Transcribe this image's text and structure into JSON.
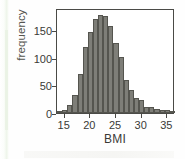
{
  "figure": {
    "name": "bmi-histogram"
  },
  "chart_data": {
    "type": "bar",
    "title": "",
    "xlabel": "BMI",
    "ylabel": "frequency",
    "xlim": [
      13.5,
      36.5
    ],
    "ylim": [
      0,
      190
    ],
    "grid": false,
    "legend": null,
    "bin_width": 1,
    "categories": [
      14,
      15,
      16,
      17,
      18,
      19,
      20,
      21,
      22,
      23,
      24,
      25,
      26,
      27,
      28,
      29,
      30,
      31,
      32,
      33,
      34,
      35,
      36
    ],
    "values": [
      3,
      6,
      14,
      32,
      70,
      120,
      147,
      170,
      178,
      175,
      157,
      127,
      101,
      59,
      41,
      27,
      23,
      11,
      10,
      8,
      6,
      5,
      3
    ],
    "xticks": [
      15,
      20,
      25,
      30,
      35
    ],
    "yticks": [
      0,
      50,
      100,
      150
    ],
    "xtick_labels": [
      "15",
      "20",
      "25",
      "30",
      "35"
    ],
    "ytick_labels": [
      "0",
      "50",
      "100",
      "150"
    ],
    "colors": {
      "bar_fill": "#7e7e78",
      "bar_edge": "#55554f",
      "axis": "#4a4a46",
      "text": "#3a3a36",
      "background": "#ffffff"
    }
  }
}
